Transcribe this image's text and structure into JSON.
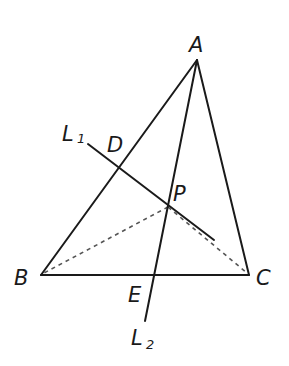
{
  "diagram": {
    "colors": {
      "line": "#1a1a1a",
      "dashed": "#555555",
      "background": "#ffffff"
    },
    "points": {
      "A": {
        "label": "A",
        "x": 197,
        "y": 60
      },
      "B": {
        "label": "B",
        "x": 41,
        "y": 275
      },
      "C": {
        "label": "C",
        "x": 249,
        "y": 275
      },
      "D": {
        "label": "D",
        "x": 118,
        "y": 166
      },
      "E": {
        "label": "E",
        "x": 154,
        "y": 275
      },
      "P": {
        "label": "P",
        "x": 168,
        "y": 207
      }
    },
    "lines": {
      "L1": {
        "label": "L",
        "subscript": "1",
        "from": [
          88,
          144
        ],
        "to": [
          214,
          240
        ]
      },
      "L2": {
        "label": "L",
        "subscript": "2",
        "from": [
          197,
          60
        ],
        "to": [
          145,
          321
        ]
      }
    },
    "segments": [
      {
        "from": "A",
        "to": "B",
        "style": "solid"
      },
      {
        "from": "A",
        "to": "C",
        "style": "solid"
      },
      {
        "from": "B",
        "to": "C",
        "style": "solid"
      },
      {
        "from": "P",
        "to": "B",
        "style": "dashed"
      },
      {
        "from": "P",
        "to": "C",
        "style": "dashed"
      }
    ]
  }
}
